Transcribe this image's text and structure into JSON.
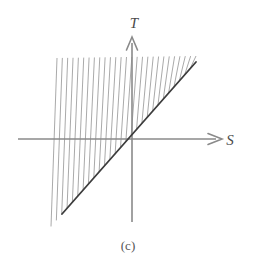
{
  "figure": {
    "caption": "(c)",
    "background_color": "#ffffff"
  },
  "axes": {
    "vertical": {
      "label": "T",
      "name": "t-axis",
      "color": "#8a8a8a",
      "x": 132,
      "y_top": 37,
      "y_bottom": 222,
      "arrow": "up",
      "label_x": 134,
      "label_y": 28
    },
    "horizontal": {
      "label": "S",
      "name": "s-axis",
      "color": "#8a8a8a",
      "y": 139,
      "x_left": 18,
      "x_right": 222,
      "arrow": "right",
      "label_x": 228,
      "label_y": 144
    },
    "origin": {
      "x": 132,
      "y": 139
    }
  },
  "chart_data": {
    "type": "line",
    "title": "",
    "subtitle": "",
    "xlabel": "S",
    "ylabel": "T",
    "grid": false,
    "legend": null,
    "annotations": [
      "(c)"
    ],
    "origin_px": {
      "x": 132,
      "y": 139
    },
    "boundary_line": {
      "name": "T = S",
      "description": "Solid dark diagonal line of slope +1 through the origin; lower-right boundary of the hatched region",
      "color": "#3c3c3c",
      "width": 1.8,
      "x1": 62,
      "y1": 214,
      "x2": 196,
      "y2": 62
    },
    "hatched_region": {
      "description": "Vertically hatched (ruled) wedge above the line T = S, extending left of it and bounded above by a near-horizontal top edge",
      "hatch_color": "#9a9a9a",
      "hatch_width": 0.85,
      "hatch_count": 27,
      "hatch_slant_dx": -6,
      "top_y_left": 58,
      "top_y_right": 56,
      "x_start": 57,
      "x_end": 196,
      "left_edge": {
        "x1": 57,
        "y1": 58,
        "x2": 62,
        "y2": 214
      }
    },
    "x": [],
    "values": []
  },
  "colors": {
    "axis": "#8a8a8a",
    "boundary": "#3c3c3c",
    "hatch": "#9a9a9a",
    "label": "#4a4a4a",
    "caption": "#555555"
  }
}
